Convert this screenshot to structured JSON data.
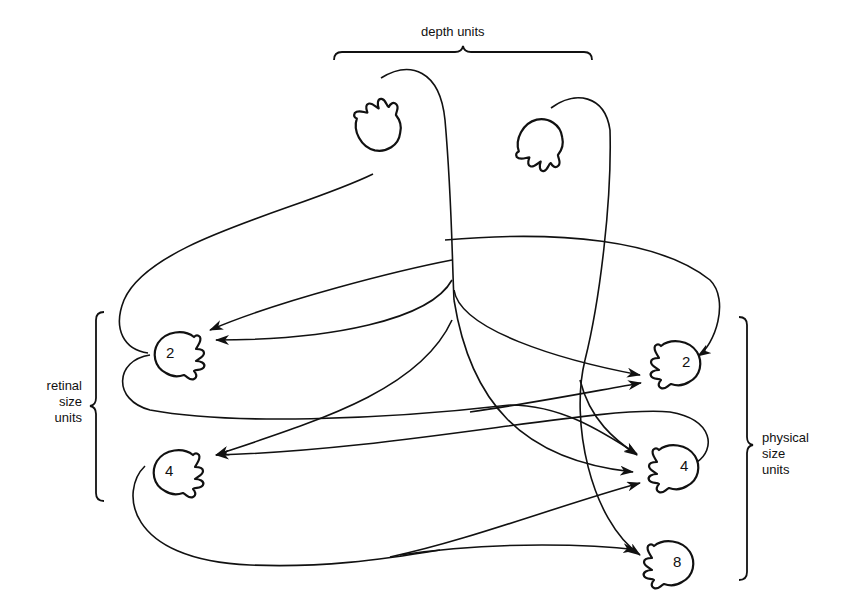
{
  "diagram": {
    "type": "neural-network",
    "groups": {
      "top": {
        "label": "depth units"
      },
      "left": {
        "label_lines": [
          "retinal",
          "size",
          "units"
        ]
      },
      "right": {
        "label_lines": [
          "physical",
          "size",
          "units"
        ]
      }
    },
    "nodes": {
      "depth_a": {
        "label": ""
      },
      "depth_b": {
        "label": ""
      },
      "retinal_2": {
        "label": "2"
      },
      "retinal_4": {
        "label": "4"
      },
      "physical_2": {
        "label": "2"
      },
      "physical_4": {
        "label": "4"
      },
      "physical_8": {
        "label": "8"
      }
    },
    "edges": [
      {
        "from": "depth_a",
        "to": "retinal_2"
      },
      {
        "from": "depth_a",
        "to": "physical_2"
      },
      {
        "from": "depth_a",
        "to": "retinal_4"
      },
      {
        "from": "depth_a",
        "to": "physical_4"
      },
      {
        "from": "depth_b",
        "to": "retinal_2"
      },
      {
        "from": "depth_b",
        "to": "physical_4"
      },
      {
        "from": "depth_b",
        "to": "physical_8"
      },
      {
        "from": "retinal_2",
        "to": "physical_2"
      },
      {
        "from": "retinal_2",
        "to": "physical_4"
      },
      {
        "from": "retinal_4",
        "to": "physical_4"
      },
      {
        "from": "retinal_4",
        "to": "physical_8"
      },
      {
        "from": "physical_2",
        "to": "retinal_2"
      },
      {
        "from": "physical_4",
        "to": "retinal_4"
      }
    ]
  }
}
